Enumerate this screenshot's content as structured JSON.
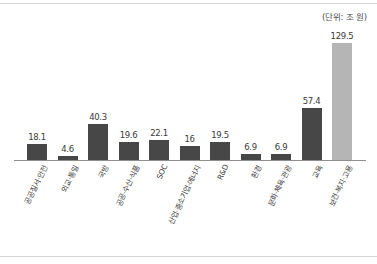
{
  "figure": {
    "unit_note": "(단위: 조 원)"
  },
  "chart_data": {
    "type": "bar",
    "title": "",
    "subtitle": "",
    "xlabel": "",
    "ylabel": "",
    "unit_note": "(단위: 조 원)",
    "grid": false,
    "legend": null,
    "ylim": [
      0,
      129.5
    ],
    "categories": [
      "공공질서·안전",
      "외교·통일",
      "국방",
      "공공·수산·식품",
      "SOC",
      "산업·중소기업·에너지",
      "R&D",
      "환경",
      "문화·체육·관광",
      "교육",
      "보건·복지·고용"
    ],
    "values": [
      18.1,
      4.6,
      40.3,
      19.6,
      22.1,
      16,
      19.5,
      6.9,
      6.9,
      57.4,
      129.5
    ],
    "value_labels": [
      "18.1",
      "4.6",
      "40.3",
      "19.6",
      "22.1",
      "16",
      "19.5",
      "6.9",
      "6.9",
      "57.4",
      "129.5"
    ],
    "bar_colors": [
      "#474747",
      "#474747",
      "#474747",
      "#474747",
      "#474747",
      "#474747",
      "#474747",
      "#474747",
      "#474747",
      "#474747",
      "#b5b5b5"
    ],
    "highlight_index": 10,
    "colors": {
      "bar_default": "#474747",
      "bar_highlight": "#b5b5b5",
      "axis": "#8f8f8f",
      "rule": "#d8d8d8",
      "text": "#3b3b3b",
      "background": "#ffffff"
    }
  }
}
